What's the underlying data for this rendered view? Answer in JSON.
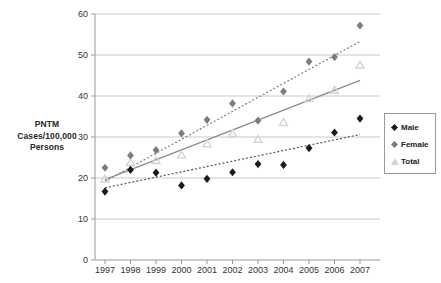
{
  "chart_data": {
    "type": "scatter",
    "title": "",
    "xlabel": "",
    "ylabel": "PNTM Cases/100,000 Persons",
    "ylabel_lines": [
      "PNTM",
      "Cases/100,000",
      "Persons"
    ],
    "categories": [
      "1997",
      "1998",
      "1999",
      "2000",
      "2001",
      "2002",
      "2003",
      "2004",
      "2005",
      "2006",
      "2007"
    ],
    "x_tick_labels": [
      "1997",
      "1998",
      "1999",
      "2000",
      "2001",
      "2002",
      "2003",
      "2004",
      "2005",
      "2006",
      "2007"
    ],
    "y_tick_labels": [
      "0",
      "10",
      "20",
      "30",
      "40",
      "50",
      "60"
    ],
    "y_ticks": [
      0,
      10,
      20,
      30,
      40,
      50,
      60
    ],
    "ylim": [
      0,
      60
    ],
    "grid": "horizontal",
    "legend_position": "right",
    "series": [
      {
        "name": "Male",
        "marker": "diamond",
        "color": "#1a1a1a",
        "trendline": "dotted",
        "trendline_endpoints": [
          17.6,
          30.6
        ],
        "values": [
          16.7,
          22.0,
          21.3,
          18.2,
          19.8,
          21.4,
          23.4,
          23.2,
          27.3,
          31.1,
          34.5
        ]
      },
      {
        "name": "Female",
        "marker": "diamond",
        "color": "#7d7d7d",
        "trendline": "dotted",
        "trendline_endpoints": [
          19.2,
          53.3
        ],
        "values": [
          22.5,
          25.5,
          26.8,
          30.9,
          34.2,
          38.2,
          34.0,
          41.1,
          48.4,
          49.5,
          57.2
        ]
      },
      {
        "name": "Total",
        "marker": "triangle",
        "color": "#d4d4d4",
        "trendline": "solid",
        "trendline_endpoints": [
          19.6,
          43.8
        ],
        "values": [
          19.8,
          23.8,
          24.3,
          25.7,
          28.4,
          30.9,
          29.5,
          33.6,
          39.4,
          41.5,
          47.6
        ]
      }
    ],
    "legend": [
      {
        "label": "Male",
        "marker": "diamond",
        "color": "#1a1a1a"
      },
      {
        "label": "Female",
        "marker": "diamond",
        "color": "#7d7d7d"
      },
      {
        "label": "Total",
        "marker": "triangle",
        "color": "#d4d4d4"
      }
    ],
    "colors": {
      "male": "#1a1a1a",
      "female": "#7d7d7d",
      "total": "#d4d4d4",
      "gridline": "#c9c9c9",
      "axis": "#9a9a9a",
      "background": "#ffffff"
    }
  }
}
